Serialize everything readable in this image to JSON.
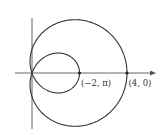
{
  "diagram": {
    "type": "polar-curve-limacon",
    "labels": {
      "point_inner": "(−2, π)",
      "point_outer": "(4, 0)"
    },
    "points": [
      {
        "label": "(−2, π)",
        "r": -2,
        "theta": "pi"
      },
      {
        "label": "(4, 0)",
        "r": 4,
        "theta": 0
      }
    ],
    "colors": {
      "curve": "#333333",
      "axis": "#555555",
      "background": "#ffffff"
    }
  }
}
